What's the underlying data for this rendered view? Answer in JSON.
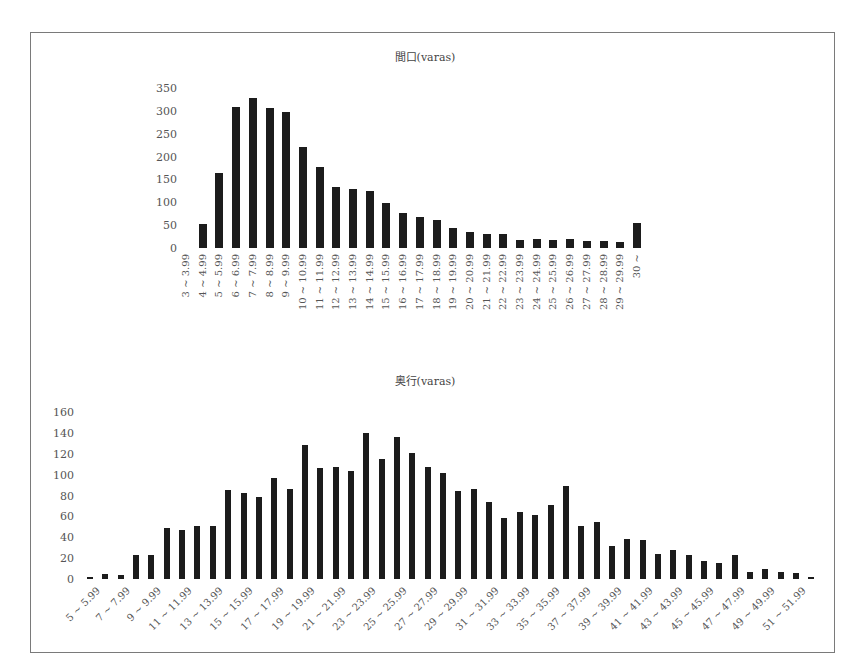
{
  "chart_data": [
    {
      "type": "bar",
      "title": "間口(varas)",
      "xlabel": "",
      "ylabel": "",
      "ylim": [
        0,
        350
      ],
      "yticks": [
        0,
        50,
        100,
        150,
        200,
        250,
        300,
        350
      ],
      "grid": false,
      "legend": null,
      "categories": [
        "3 ~ 3.99",
        "4 ~ 4.99",
        "5 ~ 5.99",
        "6 ~ 6.99",
        "7 ~ 7.99",
        "8 ~ 8.99",
        "9 ~ 9.99",
        "10 ~ 10.99",
        "11 ~ 11.99",
        "12 ~ 12.99",
        "13 ~ 13.99",
        "14 ~ 14.99",
        "15 ~ 15.99",
        "16 ~ 16.99",
        "17 ~ 17.99",
        "18 ~ 18.99",
        "19 ~ 19.99",
        "20 ~ 20.99",
        "21 ~ 21.99",
        "22 ~ 22.99",
        "23 ~ 23.99",
        "24 ~ 24.99",
        "25 ~ 25.99",
        "26 ~ 26.99",
        "27 ~ 27.99",
        "28 ~ 28.99",
        "29 ~ 29.99",
        "30 ~"
      ],
      "values": [
        0,
        52,
        163,
        309,
        329,
        306,
        298,
        222,
        177,
        133,
        128,
        124,
        98,
        76,
        67,
        61,
        44,
        36,
        30,
        30,
        17,
        19,
        17,
        20,
        15,
        15,
        14,
        54
      ]
    },
    {
      "type": "bar",
      "title": "奥行(varas)",
      "xlabel": "",
      "ylabel": "",
      "ylim": [
        0,
        160
      ],
      "yticks": [
        0,
        20,
        40,
        60,
        80,
        100,
        120,
        140,
        160
      ],
      "grid": false,
      "legend": null,
      "categories": [
        "5 ~ 5.99",
        "6 ~ 6.99",
        "7 ~ 7.99",
        "8 ~ 8.99",
        "9 ~ 9.99",
        "10 ~ 10.99",
        "11 ~ 11.99",
        "12 ~ 12.99",
        "13 ~ 13.99",
        "14 ~ 14.99",
        "15 ~ 15.99",
        "16 ~ 16.99",
        "17 ~ 17.99",
        "18 ~ 18.99",
        "19 ~ 19.99",
        "20 ~ 20.99",
        "21 ~ 21.99",
        "22 ~ 22.99",
        "23 ~ 23.99",
        "24 ~ 24.99",
        "25 ~ 25.99",
        "26 ~ 26.99",
        "27 ~ 27.99",
        "28 ~ 28.99",
        "29 ~ 29.99",
        "30 ~ 30.99",
        "31 ~ 31.99",
        "32 ~ 32.99",
        "33 ~ 33.99",
        "34 ~ 34.99",
        "35 ~ 35.99",
        "36 ~ 36.99",
        "37 ~ 37.99",
        "38 ~ 38.99",
        "39 ~ 39.99",
        "40 ~ 40.99",
        "41 ~ 41.99",
        "42 ~ 42.99",
        "43 ~ 43.99",
        "44 ~ 44.99",
        "45 ~ 45.99",
        "46 ~ 46.99",
        "47 ~ 47.99",
        "48 ~ 48.99",
        "49 ~ 49.99",
        "50 ~ 50.99",
        "51 ~ 51.99",
        "52 ~ 52.99"
      ],
      "shown_tick_labels": [
        "5 ~ 5.99",
        "7 ~ 7.99",
        "9 ~ 9.99",
        "11 ~ 11.99",
        "13 ~ 13.99",
        "15 ~ 15.99",
        "17 ~ 17.99",
        "19 ~ 19.99",
        "21 ~ 21.99",
        "23 ~ 23.99",
        "25 ~ 25.99",
        "27 ~ 27.99",
        "29 ~ 29.99",
        "31 ~ 31.99",
        "33 ~ 33.99",
        "35 ~ 35.99",
        "37 ~ 37.99",
        "39 ~ 39.99",
        "41 ~ 41.99",
        "43 ~ 43.99",
        "45 ~ 45.99",
        "47 ~ 47.99",
        "49 ~ 49.99",
        "51 ~ 51.99"
      ],
      "values": [
        2,
        5,
        4,
        23,
        23,
        49,
        47,
        51,
        51,
        85,
        82,
        79,
        97,
        86,
        128,
        106,
        107,
        103,
        140,
        115,
        136,
        121,
        107,
        102,
        84,
        86,
        74,
        58,
        64,
        61,
        71,
        89,
        51,
        55,
        32,
        38,
        37,
        24,
        28,
        23,
        17,
        15,
        23,
        7,
        10,
        7,
        6,
        1
      ]
    }
  ]
}
